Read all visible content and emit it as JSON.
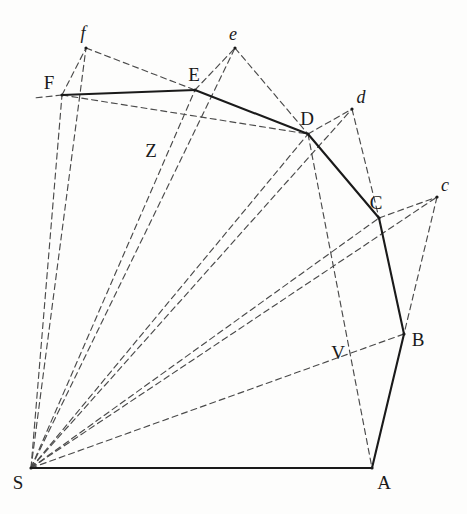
{
  "figure": {
    "title": "",
    "type": "geometric-diagram",
    "width": 467,
    "height": 514,
    "background_color": "#fdfdfc",
    "solid_line_color": "#1a1a1a",
    "dashed_line_color": "#4a4a4a"
  },
  "points": {
    "S": {
      "label": "S",
      "x": 31,
      "y": 468,
      "style": "upright",
      "label_dx": -13,
      "label_dy": 14
    },
    "A": {
      "label": "A",
      "x": 372,
      "y": 468,
      "style": "upright",
      "label_dx": 12,
      "label_dy": 14
    },
    "B": {
      "label": "B",
      "x": 404,
      "y": 334,
      "style": "upright",
      "label_dx": 14,
      "label_dy": 5
    },
    "C": {
      "label": "C",
      "x": 379,
      "y": 218,
      "style": "upright",
      "label_dx": -3,
      "label_dy": -16
    },
    "D": {
      "label": "D",
      "x": 308,
      "y": 134,
      "style": "upright",
      "label_dx": -1,
      "label_dy": -16
    },
    "E": {
      "label": "E",
      "x": 195,
      "y": 90,
      "style": "upright",
      "label_dx": -1,
      "label_dy": -16
    },
    "F": {
      "label": "F",
      "x": 62,
      "y": 95,
      "style": "upright",
      "label_dx": -13,
      "label_dy": -13
    },
    "c": {
      "label": "c",
      "x": 437,
      "y": 197,
      "style": "italic",
      "label_dx": 8,
      "label_dy": -12
    },
    "d": {
      "label": "d",
      "x": 352,
      "y": 109,
      "style": "italic",
      "label_dx": 9,
      "label_dy": -12
    },
    "e": {
      "label": "e",
      "x": 235,
      "y": 48,
      "style": "italic",
      "label_dx": -2,
      "label_dy": -14
    },
    "f": {
      "label": "f",
      "x": 86,
      "y": 48,
      "style": "italic",
      "label_dx": -3,
      "label_dy": -15
    },
    "Z": {
      "label": "Z",
      "x": 161,
      "y": 148,
      "style": "upright",
      "label_dx": -10,
      "label_dy": 2
    },
    "V": {
      "label": "V",
      "x": 348,
      "y": 351,
      "style": "upright",
      "label_dx": -10,
      "label_dy": 1
    }
  },
  "solid_edges": [
    {
      "name": "edge-S-A",
      "from": "S",
      "to": "A"
    },
    {
      "name": "edge-A-B",
      "from": "A",
      "to": "B"
    },
    {
      "name": "edge-B-C",
      "from": "B",
      "to": "C"
    },
    {
      "name": "edge-C-D",
      "from": "C",
      "to": "D"
    },
    {
      "name": "edge-D-E",
      "from": "D",
      "to": "E"
    },
    {
      "name": "edge-E-F",
      "from": "E",
      "to": "F"
    }
  ],
  "dashed_edges": [
    {
      "name": "ray-S-F",
      "from": "S",
      "to": "F"
    },
    {
      "name": "ray-S-f",
      "from": "S",
      "to": "f"
    },
    {
      "name": "ray-S-E",
      "from": "S",
      "to": "E"
    },
    {
      "name": "ray-S-e",
      "from": "S",
      "to": "e"
    },
    {
      "name": "ray-S-D",
      "from": "S",
      "to": "D"
    },
    {
      "name": "ray-S-d",
      "from": "S",
      "to": "d"
    },
    {
      "name": "ray-S-C",
      "from": "S",
      "to": "C"
    },
    {
      "name": "ray-S-c",
      "from": "S",
      "to": "c"
    },
    {
      "name": "ray-S-B",
      "from": "S",
      "to": "B"
    },
    {
      "name": "chord-F-f",
      "from": "F",
      "to": "f"
    },
    {
      "name": "chord-f-E",
      "from": "f",
      "to": "E"
    },
    {
      "name": "chord-E-e",
      "from": "E",
      "to": "e"
    },
    {
      "name": "chord-e-D",
      "from": "e",
      "to": "D"
    },
    {
      "name": "chord-D-d",
      "from": "D",
      "to": "d"
    },
    {
      "name": "chord-d-C",
      "from": "d",
      "to": "C"
    },
    {
      "name": "chord-C-c",
      "from": "C",
      "to": "c"
    },
    {
      "name": "chord-c-B",
      "from": "c",
      "to": "B"
    },
    {
      "name": "chord-F-D",
      "from": "F",
      "to": "D"
    },
    {
      "name": "chord-D-A",
      "from": "D",
      "to": "A"
    },
    {
      "name": "stub-left-of-F",
      "from": "F",
      "to": "stubF"
    }
  ],
  "extra_vertices": {
    "stubF": {
      "x": 34,
      "y": 98
    }
  },
  "intersection_marks": [
    {
      "name": "mark-Z",
      "point": "Z",
      "note": "crossing of S-E/S-e rays with F-D chord"
    },
    {
      "name": "mark-V",
      "point": "V",
      "note": "crossing of D-A chord with c-B chord"
    }
  ]
}
